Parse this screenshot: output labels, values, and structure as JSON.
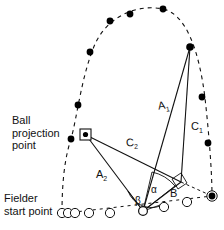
{
  "figure": {
    "type": "geometry-diagram",
    "title_visible": false,
    "background_color": "#ffffff",
    "stroke_color": "#111111",
    "marker_fill": "#000000",
    "width": 224,
    "height": 230
  },
  "captions": [
    {
      "name": "ball-projection-point-caption",
      "lines": [
        "Ball",
        "projection",
        "point"
      ],
      "text": "Ball projection point",
      "x": 12,
      "y": 116
    },
    {
      "name": "fielder-start-point-caption",
      "lines": [
        "Fielder",
        "start point"
      ],
      "text": "Fielder start point",
      "x": 4,
      "y": 194
    }
  ],
  "segment_labels": [
    {
      "name": "segment-label-a1",
      "base": "A",
      "sub": "1",
      "x": 158,
      "y": 104
    },
    {
      "name": "segment-label-c1",
      "base": "C",
      "sub": "1",
      "x": 192,
      "y": 125
    },
    {
      "name": "segment-label-c2",
      "base": "C",
      "sub": "2",
      "x": 127,
      "y": 141
    },
    {
      "name": "segment-label-a2",
      "base": "A",
      "sub": "2",
      "x": 97,
      "y": 173
    },
    {
      "name": "segment-label-b",
      "base": "B",
      "sub": "",
      "x": 171,
      "y": 192
    }
  ],
  "angle_labels": [
    {
      "name": "angle-label-alpha",
      "glyph": "α",
      "x": 152,
      "y": 189
    },
    {
      "name": "angle-label-beta",
      "glyph": "β",
      "x": 136,
      "y": 200
    }
  ],
  "points": {
    "ball_projection_point": {
      "x": 85,
      "y": 134,
      "marker": "square-with-dot"
    },
    "fielder_vertex": {
      "x": 143,
      "y": 211,
      "marker": "open-circle-small"
    },
    "ball_landing_point": {
      "x": 212,
      "y": 196,
      "marker": "filled-dot-ringed"
    },
    "ball_apex_side_point": {
      "x": 190,
      "y": 47,
      "marker": "filled-dot"
    },
    "right_angle_corner": {
      "x": 180,
      "y": 181,
      "marker": "right-angle-square"
    }
  },
  "trajectory": {
    "name": "ball-flight-path",
    "style": "dashed",
    "dot_marker": "filled-dot",
    "dots": [
      {
        "x": 71,
        "y": 139
      },
      {
        "x": 78,
        "y": 105
      },
      {
        "x": 90,
        "y": 52
      },
      {
        "x": 110,
        "y": 21
      },
      {
        "x": 130,
        "y": 14
      },
      {
        "x": 163,
        "y": 9
      },
      {
        "x": 190,
        "y": 47
      },
      {
        "x": 202,
        "y": 97
      },
      {
        "x": 208,
        "y": 143
      },
      {
        "x": 212,
        "y": 196
      }
    ]
  },
  "fielder_path": {
    "name": "fielder-run-path",
    "style": "dashed",
    "dot_marker": "open-circle",
    "circles": [
      {
        "x": 62,
        "y": 213,
        "r": 5
      },
      {
        "x": 68,
        "y": 213,
        "r": 5
      },
      {
        "x": 75,
        "y": 213,
        "r": 5
      },
      {
        "x": 89,
        "y": 213,
        "r": 5
      },
      {
        "x": 110,
        "y": 213,
        "r": 5
      },
      {
        "x": 143,
        "y": 211,
        "r": 5
      },
      {
        "x": 164,
        "y": 207,
        "r": 5
      },
      {
        "x": 187,
        "y": 202,
        "r": 5
      }
    ]
  },
  "solid_segments": [
    {
      "name": "segment-a1",
      "from": "fielder_vertex",
      "to": "ball_apex_side_point"
    },
    {
      "name": "segment-c1",
      "from": "right_angle_corner",
      "to": "ball_apex_side_point"
    },
    {
      "name": "segment-c2",
      "from": "ball_projection_point",
      "to": "right_angle_corner"
    },
    {
      "name": "segment-a2",
      "from": "ball_projection_point",
      "to": "fielder_vertex"
    },
    {
      "name": "segment-b",
      "from": "fielder_vertex",
      "to": "right_angle_corner"
    },
    {
      "name": "segment-baseline",
      "from": "right_angle_corner",
      "to": "ball_landing_point"
    }
  ]
}
